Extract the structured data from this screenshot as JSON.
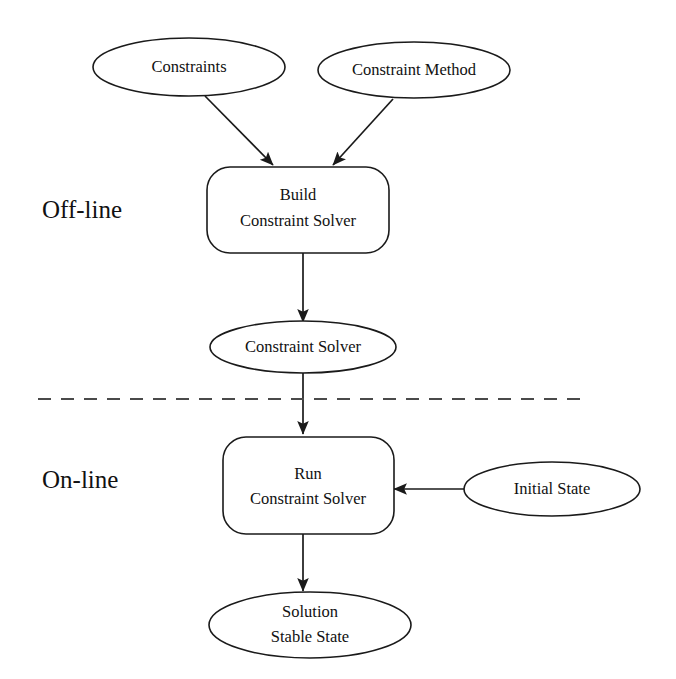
{
  "diagram": {
    "colors": {
      "background": "#ffffff",
      "stroke": "#1a1a1a",
      "text": "#111111",
      "divider": "#4a4a4a"
    },
    "phases": [
      {
        "id": "offline",
        "label": "Off-line"
      },
      {
        "id": "online",
        "label": "On-line"
      }
    ],
    "nodes": [
      {
        "id": "constraints",
        "shape": "ellipse",
        "lines": [
          "Constraints"
        ]
      },
      {
        "id": "constraint-method",
        "shape": "ellipse",
        "lines": [
          "Constraint Method"
        ]
      },
      {
        "id": "build-solver",
        "shape": "rounded-rectangle",
        "lines": [
          "Build",
          "Constraint Solver"
        ]
      },
      {
        "id": "constraint-solver",
        "shape": "ellipse",
        "lines": [
          "Constraint Solver"
        ]
      },
      {
        "id": "run-solver",
        "shape": "rounded-rectangle",
        "lines": [
          "Run",
          "Constraint Solver"
        ]
      },
      {
        "id": "initial-state",
        "shape": "ellipse",
        "lines": [
          "Initial State"
        ]
      },
      {
        "id": "solution",
        "shape": "ellipse",
        "lines": [
          "Solution",
          "Stable State"
        ]
      }
    ],
    "edges": [
      {
        "id": "constraints-to-build",
        "from": "constraints",
        "to": "build-solver",
        "arrow": "end",
        "direction": "diagonal-down-right"
      },
      {
        "id": "method-to-build",
        "from": "constraint-method",
        "to": "build-solver",
        "arrow": "end",
        "direction": "diagonal-down-left"
      },
      {
        "id": "build-to-solver",
        "from": "build-solver",
        "to": "constraint-solver",
        "arrow": "end",
        "direction": "down"
      },
      {
        "id": "solver-to-run",
        "from": "constraint-solver",
        "to": "run-solver",
        "arrow": "end",
        "direction": "down"
      },
      {
        "id": "initial-state-to-run",
        "from": "initial-state",
        "to": "run-solver",
        "arrow": "end",
        "direction": "left"
      },
      {
        "id": "run-to-solution",
        "from": "run-solver",
        "to": "solution",
        "arrow": "end",
        "direction": "down"
      }
    ],
    "divider": {
      "id": "phase-divider",
      "style": "dashed",
      "orientation": "horizontal"
    }
  }
}
